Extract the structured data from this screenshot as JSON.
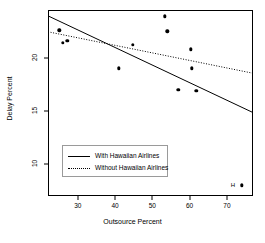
{
  "chart_data": {
    "type": "scatter",
    "title": "",
    "xlabel": "Outsource Percent",
    "ylabel": "Delay Percent",
    "xlim": [
      22,
      77
    ],
    "ylim": [
      7,
      24.5
    ],
    "xticks": [
      30,
      40,
      50,
      60,
      70
    ],
    "xticklabels": [
      "30",
      "40",
      "50",
      "60",
      "70"
    ],
    "yticks": [
      10,
      15,
      20
    ],
    "yticklabels": [
      "10",
      "15",
      "20"
    ],
    "grid": false,
    "legend_position": "lower-left-inside",
    "points": [
      {
        "x": 25.0,
        "y": 22.6,
        "label": ""
      },
      {
        "x": 26.0,
        "y": 21.4,
        "label": ""
      },
      {
        "x": 27.2,
        "y": 21.6,
        "label": ""
      },
      {
        "x": 41.0,
        "y": 19.0,
        "label": ""
      },
      {
        "x": 44.8,
        "y": 21.2,
        "label": ""
      },
      {
        "x": 53.3,
        "y": 23.9,
        "label": ""
      },
      {
        "x": 54.0,
        "y": 22.5,
        "label": ""
      },
      {
        "x": 57.0,
        "y": 17.0,
        "label": ""
      },
      {
        "x": 60.3,
        "y": 20.8,
        "label": ""
      },
      {
        "x": 60.5,
        "y": 19.0,
        "label": ""
      },
      {
        "x": 61.8,
        "y": 16.9,
        "label": ""
      },
      {
        "x": 74.0,
        "y": 8.0,
        "label": "H"
      }
    ],
    "series": [
      {
        "name": "With Hawaiian Airlines",
        "type": "line",
        "style": "solid",
        "color": "#000000",
        "x": [
          22.0,
          77.0
        ],
        "y": [
          23.95,
          14.85
        ]
      },
      {
        "name": "Without Hawaiian Airlines",
        "type": "line",
        "style": "dotted",
        "color": "#000000",
        "x": [
          22.0,
          77.0
        ],
        "y": [
          22.45,
          18.55
        ]
      }
    ]
  },
  "legend": {
    "entries": [
      {
        "label": "With Hawaiian Airlines",
        "style": "solid"
      },
      {
        "label": "Without Hawaiian Airlines",
        "style": "dotted"
      }
    ]
  },
  "axes": {
    "x_title": "Outsource Percent",
    "y_title": "Delay Percent"
  }
}
